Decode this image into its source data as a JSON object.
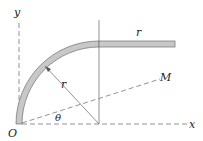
{
  "diagram": {
    "labels": {
      "y_axis": "y",
      "x_axis": "x",
      "origin": "O",
      "radius_arc": "r",
      "bar_length": "r",
      "moment_line": "M",
      "angle": "θ"
    },
    "colors": {
      "rod_fill": "#c8c8c8",
      "rod_stroke": "#6e6e6e",
      "line": "#777777",
      "text": "#222222",
      "background": "#ffffff"
    }
  }
}
